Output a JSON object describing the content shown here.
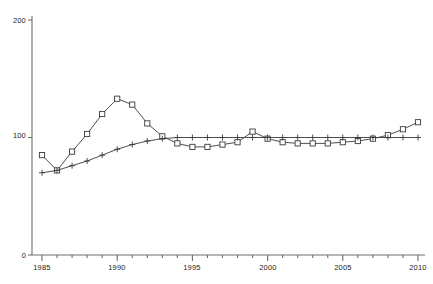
{
  "chart_data": {
    "type": "line",
    "title": "",
    "subtitle": "",
    "xlabel": "",
    "ylabel": "",
    "xlim": [
      1985,
      2010
    ],
    "ylim": [
      0,
      200
    ],
    "yticks": [
      0,
      100,
      200
    ],
    "ytick_labels": [
      "0",
      "100",
      "200"
    ],
    "xticks": [
      1985,
      1986,
      1987,
      1988,
      1989,
      1990,
      1991,
      1992,
      1993,
      1994,
      1995,
      1996,
      1997,
      1998,
      1999,
      2000,
      2001,
      2002,
      2003,
      2004,
      2005,
      2006,
      2007,
      2008,
      2009,
      2010
    ],
    "xtick_labels_shown": [
      "1985",
      "1990",
      "1995",
      "2000",
      "2005",
      "2010"
    ],
    "xtick_labels_shown_values": [
      1985,
      1990,
      1995,
      2000,
      2005,
      2010
    ],
    "grid": false,
    "legend": "none",
    "x": [
      1985,
      1986,
      1987,
      1988,
      1989,
      1990,
      1991,
      1992,
      1993,
      1994,
      1995,
      1996,
      1997,
      1998,
      1999,
      2000,
      2001,
      2002,
      2003,
      2004,
      2005,
      2006,
      2007,
      2008,
      2009,
      2010
    ],
    "series": [
      {
        "name": "square-series",
        "marker": "square",
        "color": "#3a3a3a",
        "values": [
          85,
          72,
          88,
          103,
          120,
          133,
          128,
          112,
          101,
          95,
          92,
          92,
          94,
          96,
          105,
          99,
          96,
          95,
          95,
          95,
          96,
          97,
          99,
          102,
          107,
          113
        ]
      },
      {
        "name": "plus-series",
        "marker": "plus",
        "color": "#3a3a3a",
        "values": [
          70,
          72,
          76,
          80,
          85,
          90,
          94,
          97,
          99,
          100,
          100,
          100,
          100,
          100,
          100,
          100,
          100,
          100,
          100,
          100,
          100,
          100,
          100,
          100,
          100,
          100
        ]
      }
    ]
  },
  "axes": {
    "y_labels": [
      "200",
      "100",
      "0"
    ],
    "x_labels": [
      "1985",
      "1990",
      "1995",
      "2000",
      "2005",
      "2010"
    ]
  }
}
